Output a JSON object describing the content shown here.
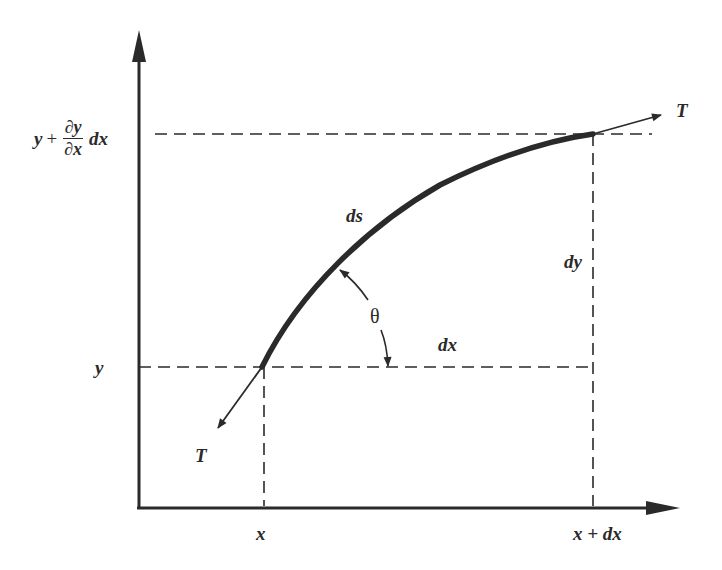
{
  "diagram": {
    "type": "string-element-tension-diagram",
    "colors": {
      "ink": "#2a2a2a",
      "curve": "#2a2a2a",
      "background": "#ffffff"
    },
    "axes": {
      "origin": [
        139,
        508
      ],
      "y_axis_top": 30,
      "x_axis_right": 678
    },
    "labels": {
      "tension_top": "T",
      "tension_bottom": "T",
      "arc_length": "ds",
      "delta_y": "dy",
      "delta_x": "dx",
      "angle": "θ",
      "y_lower": "y",
      "y_upper_prefix": "y",
      "y_upper_plus": "+",
      "y_upper_frac_num": "∂y",
      "y_upper_frac_den": "∂x",
      "y_upper_suffix": "dx",
      "x_left": "x",
      "x_right": "x + dx"
    },
    "points": {
      "curve_start": [
        262,
        367
      ],
      "curve_end": [
        593,
        134
      ]
    }
  }
}
